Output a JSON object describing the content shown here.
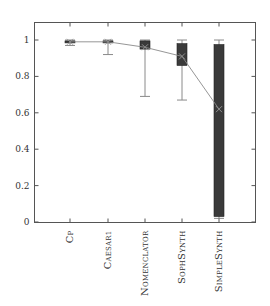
{
  "chart_data": {
    "type": "box",
    "title": "",
    "xlabel": "",
    "ylabel": "",
    "ylim": [
      0,
      1.1
    ],
    "yticks": [
      0,
      0.2,
      0.4,
      0.6,
      0.8,
      1
    ],
    "ytick_labels": [
      "0",
      "0.2",
      "0.4",
      "0.6",
      "0.8",
      "1"
    ],
    "categories": [
      "Cp",
      "Caesar1",
      "Nomenclator",
      "SophSynth",
      "SimpleSynth"
    ],
    "category_display": [
      {
        "first": "C",
        "rest": "P"
      },
      {
        "first": "C",
        "rest": "AESAR1"
      },
      {
        "first": "N",
        "rest": "OMENCLATOR"
      },
      {
        "first": "S",
        "rest": "OPH",
        "first2": "S",
        "rest2": "YNTH"
      },
      {
        "first": "S",
        "rest": "IMPLE",
        "first2": "S",
        "rest2": "YNTH"
      }
    ],
    "series": [
      {
        "name": "Cp",
        "whisker_low": 0.97,
        "q1": 0.985,
        "median": 0.99,
        "q3": 0.995,
        "whisker_high": 1.0,
        "mean": 0.99
      },
      {
        "name": "Caesar1",
        "whisker_low": 0.92,
        "q1": 0.985,
        "median": 0.99,
        "q3": 0.995,
        "whisker_high": 1.0,
        "mean": 0.99
      },
      {
        "name": "Nomenclator",
        "whisker_low": 0.69,
        "q1": 0.95,
        "median": 0.98,
        "q3": 0.995,
        "whisker_high": 1.0,
        "mean": 0.96
      },
      {
        "name": "SophSynth",
        "whisker_low": 0.67,
        "q1": 0.86,
        "median": 0.93,
        "q3": 0.98,
        "whisker_high": 1.0,
        "mean": 0.91
      },
      {
        "name": "SimpleSynth",
        "whisker_low": 0.02,
        "q1": 0.03,
        "median": 0.7,
        "q3": 0.975,
        "whisker_high": 1.0,
        "mean": 0.62
      }
    ],
    "mean_line": true,
    "grid": false,
    "legend": null,
    "colors": {
      "box_fill": "#3a3a3a",
      "whisker": "#8a8a8a",
      "mean_line": "#8a8a8a",
      "frame": "#555555"
    }
  }
}
